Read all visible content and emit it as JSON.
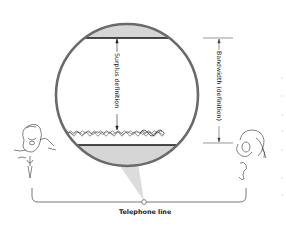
{
  "diagram": {
    "title": "",
    "labels": {
      "surplus": "Surplus definition",
      "bandwidth": "Bandwidth (definition)",
      "telephone_line": "Telephone line"
    },
    "elements": {
      "magnifier_circle": {
        "cx": 127,
        "cy": 95,
        "r": 72,
        "stroke": "#666666",
        "fill_band": "#d4d4d4"
      },
      "upper_channel_line_y": 38,
      "lower_channel_line_y": 145,
      "signal_wave_y": 133,
      "speaker_left": "man speaking into microphone",
      "listener_right": "man listening on phone"
    },
    "colors": {
      "ink": "#222222",
      "circle_stroke": "#6a6a6a",
      "band_fill": "#d6d6d6",
      "cone_fill": "#dcdcdc"
    }
  }
}
